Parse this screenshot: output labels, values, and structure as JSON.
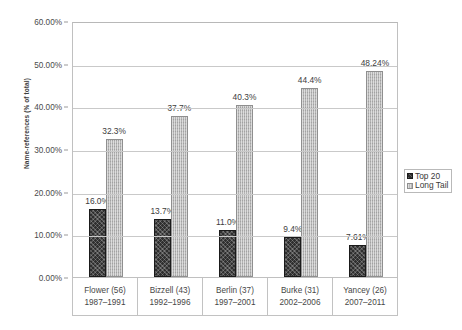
{
  "chart_data": {
    "type": "bar",
    "title": "",
    "subtitle": "",
    "xlabel": "",
    "ylabel": "Name-references (% of total)",
    "ylim": [
      0,
      60
    ],
    "ytick_labels": [
      "60.00%",
      "50.00%",
      "40.00%",
      "30.00%",
      "20.00%",
      "10.00%",
      "0.00%"
    ],
    "ytick_values": [
      60,
      50,
      40,
      30,
      20,
      10,
      0
    ],
    "grid": true,
    "legend_position": "right",
    "categories": [
      "Flower (56)",
      "Bizzell (43)",
      "Berlin (37)",
      "Burke (31)",
      "Yancey (26)"
    ],
    "category_sublabels": [
      "1987–1991",
      "1992–1996",
      "1997–2001",
      "2002–2006",
      "2007–2011"
    ],
    "series": [
      {
        "name": "Top 20",
        "values": [
          16.0,
          13.7,
          11.0,
          9.4,
          7.61
        ],
        "labels": [
          "16.0%",
          "13.7%",
          "11.0%",
          "9.4%",
          "7.61%"
        ],
        "color": "#2f2f2f"
      },
      {
        "name": "Long Tail",
        "values": [
          32.3,
          37.7,
          40.3,
          44.4,
          48.24
        ],
        "labels": [
          "32.3%",
          "37.7%",
          "40.3%",
          "44.4%",
          "48.24%"
        ],
        "color": "#b4b4b4"
      }
    ]
  },
  "legend": {
    "items": [
      {
        "label": "Top 20"
      },
      {
        "label": "Long Tail"
      }
    ]
  }
}
